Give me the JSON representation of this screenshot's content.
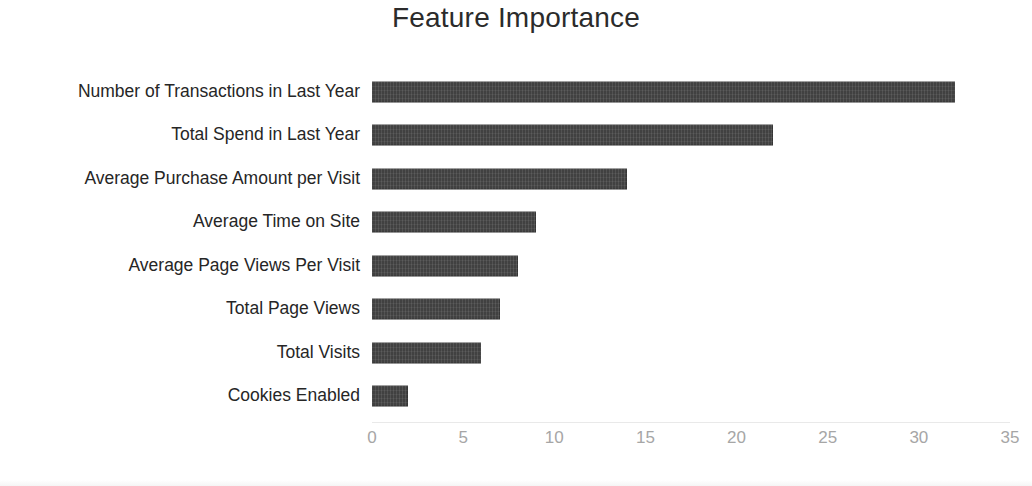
{
  "chart_data": {
    "type": "bar",
    "orientation": "horizontal",
    "title": "Feature Importance",
    "xlabel": "",
    "ylabel": "",
    "xlim": [
      0,
      35
    ],
    "xticks": [
      0,
      5,
      10,
      15,
      20,
      25,
      30,
      35
    ],
    "xtick_labels": [
      "0",
      "5",
      "10",
      "15",
      "20",
      "25",
      "30",
      "35"
    ],
    "grid": false,
    "legend": false,
    "bar_color": "#414141",
    "tick_label_color": "#a6a6a6",
    "title_color": "#2b2b2b",
    "category_label_color": "#262626",
    "background_color": "#ffffff",
    "categories": [
      "Number of Transactions in Last Year",
      "Total Spend in Last Year",
      "Average Purchase Amount per Visit",
      "Average Time on Site",
      "Average Page Views Per Visit",
      "Total Page Views",
      "Total Visits",
      "Cookies Enabled"
    ],
    "values": [
      32,
      22,
      14,
      9,
      8,
      7,
      6,
      2
    ],
    "series": [
      {
        "name": "Importance",
        "values": [
          32,
          22,
          14,
          9,
          8,
          7,
          6,
          2
        ]
      }
    ]
  }
}
